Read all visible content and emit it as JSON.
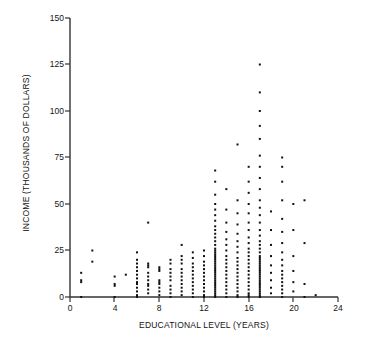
{
  "chart_data": {
    "type": "scatter",
    "title": "",
    "xlabel": "EDUCATIONAL LEVEL (YEARS)",
    "ylabel": "INCOME (THOUSANDS OF DOLLARS)",
    "xlim": [
      0,
      24
    ],
    "ylim": [
      0,
      150
    ],
    "xticks": [
      0,
      4,
      8,
      12,
      16,
      20,
      24
    ],
    "yticks": [
      0,
      25,
      50,
      75,
      100,
      125,
      150
    ],
    "xtick_labels": [
      "0",
      "4",
      "8",
      "12",
      "16",
      "20",
      "24"
    ],
    "ytick_labels": [
      "0",
      "25",
      "50",
      "75",
      "100",
      "125",
      "150"
    ],
    "grid": false,
    "legend": null,
    "marker": "square-dot",
    "marker_color": "#111111",
    "marker_size_px": 2,
    "points": [
      [
        1,
        0
      ],
      [
        1,
        8
      ],
      [
        1,
        9
      ],
      [
        1,
        13
      ],
      [
        2,
        19
      ],
      [
        2,
        25
      ],
      [
        4,
        0
      ],
      [
        4,
        6
      ],
      [
        4,
        7
      ],
      [
        4,
        11
      ],
      [
        5,
        12
      ],
      [
        6,
        0
      ],
      [
        6,
        1
      ],
      [
        6,
        3
      ],
      [
        6,
        5
      ],
      [
        6,
        7
      ],
      [
        6,
        8
      ],
      [
        6,
        10
      ],
      [
        6,
        12
      ],
      [
        6,
        14
      ],
      [
        6,
        16
      ],
      [
        6,
        18
      ],
      [
        6,
        20
      ],
      [
        6,
        24
      ],
      [
        7,
        2
      ],
      [
        7,
        4
      ],
      [
        7,
        6
      ],
      [
        7,
        7
      ],
      [
        7,
        9
      ],
      [
        7,
        11
      ],
      [
        7,
        13
      ],
      [
        7,
        16
      ],
      [
        7,
        17
      ],
      [
        7,
        18
      ],
      [
        7,
        40
      ],
      [
        8,
        1
      ],
      [
        8,
        3
      ],
      [
        8,
        5
      ],
      [
        8,
        7
      ],
      [
        8,
        8
      ],
      [
        8,
        9
      ],
      [
        8,
        14
      ],
      [
        8,
        15
      ],
      [
        8,
        16
      ],
      [
        9,
        0
      ],
      [
        9,
        2
      ],
      [
        9,
        4
      ],
      [
        9,
        6
      ],
      [
        9,
        9
      ],
      [
        9,
        11
      ],
      [
        9,
        13
      ],
      [
        9,
        15
      ],
      [
        9,
        18
      ],
      [
        9,
        20
      ],
      [
        10,
        1
      ],
      [
        10,
        3
      ],
      [
        10,
        5
      ],
      [
        10,
        7
      ],
      [
        10,
        9
      ],
      [
        10,
        11
      ],
      [
        10,
        13
      ],
      [
        10,
        15
      ],
      [
        10,
        18
      ],
      [
        10,
        20
      ],
      [
        10,
        22
      ],
      [
        10,
        28
      ],
      [
        11,
        0
      ],
      [
        11,
        2
      ],
      [
        11,
        4
      ],
      [
        11,
        6
      ],
      [
        11,
        8
      ],
      [
        11,
        10
      ],
      [
        11,
        12
      ],
      [
        11,
        14
      ],
      [
        11,
        16
      ],
      [
        11,
        18
      ],
      [
        11,
        21
      ],
      [
        11,
        24
      ],
      [
        12,
        0
      ],
      [
        12,
        1
      ],
      [
        12,
        3
      ],
      [
        12,
        5
      ],
      [
        12,
        7
      ],
      [
        12,
        9
      ],
      [
        12,
        11
      ],
      [
        12,
        13
      ],
      [
        12,
        15
      ],
      [
        12,
        17
      ],
      [
        12,
        19
      ],
      [
        12,
        22
      ],
      [
        12,
        25
      ],
      [
        13,
        0
      ],
      [
        13,
        1
      ],
      [
        13,
        2
      ],
      [
        13,
        3
      ],
      [
        13,
        4
      ],
      [
        13,
        5
      ],
      [
        13,
        6
      ],
      [
        13,
        7
      ],
      [
        13,
        8
      ],
      [
        13,
        9
      ],
      [
        13,
        10
      ],
      [
        13,
        11
      ],
      [
        13,
        12
      ],
      [
        13,
        13
      ],
      [
        13,
        14
      ],
      [
        13,
        15
      ],
      [
        13,
        16
      ],
      [
        13,
        17
      ],
      [
        13,
        18
      ],
      [
        13,
        19
      ],
      [
        13,
        20
      ],
      [
        13,
        21
      ],
      [
        13,
        22
      ],
      [
        13,
        23
      ],
      [
        13,
        24
      ],
      [
        13,
        25
      ],
      [
        13,
        26
      ],
      [
        13,
        28
      ],
      [
        13,
        30
      ],
      [
        13,
        32
      ],
      [
        13,
        34
      ],
      [
        13,
        36
      ],
      [
        13,
        38
      ],
      [
        13,
        41
      ],
      [
        13,
        44
      ],
      [
        13,
        47
      ],
      [
        13,
        50
      ],
      [
        13,
        55
      ],
      [
        13,
        62
      ],
      [
        13,
        68
      ],
      [
        14,
        0
      ],
      [
        14,
        2
      ],
      [
        14,
        4
      ],
      [
        14,
        6
      ],
      [
        14,
        8
      ],
      [
        14,
        10
      ],
      [
        14,
        12
      ],
      [
        14,
        14
      ],
      [
        14,
        16
      ],
      [
        14,
        18
      ],
      [
        14,
        20
      ],
      [
        14,
        22
      ],
      [
        14,
        25
      ],
      [
        14,
        28
      ],
      [
        14,
        31
      ],
      [
        14,
        35
      ],
      [
        14,
        40
      ],
      [
        14,
        47
      ],
      [
        14,
        58
      ],
      [
        15,
        0
      ],
      [
        15,
        1
      ],
      [
        15,
        3
      ],
      [
        15,
        5
      ],
      [
        15,
        7
      ],
      [
        15,
        9
      ],
      [
        15,
        11
      ],
      [
        15,
        13
      ],
      [
        15,
        15
      ],
      [
        15,
        17
      ],
      [
        15,
        19
      ],
      [
        15,
        21
      ],
      [
        15,
        24
      ],
      [
        15,
        27
      ],
      [
        15,
        30
      ],
      [
        15,
        34
      ],
      [
        15,
        39
      ],
      [
        15,
        45
      ],
      [
        15,
        52
      ],
      [
        15,
        82
      ],
      [
        16,
        0
      ],
      [
        16,
        1
      ],
      [
        16,
        2
      ],
      [
        16,
        4
      ],
      [
        16,
        6
      ],
      [
        16,
        8
      ],
      [
        16,
        10
      ],
      [
        16,
        12
      ],
      [
        16,
        14
      ],
      [
        16,
        16
      ],
      [
        16,
        18
      ],
      [
        16,
        20
      ],
      [
        16,
        22
      ],
      [
        16,
        24
      ],
      [
        16,
        26
      ],
      [
        16,
        29
      ],
      [
        16,
        32
      ],
      [
        16,
        36
      ],
      [
        16,
        40
      ],
      [
        16,
        45
      ],
      [
        16,
        50
      ],
      [
        16,
        56
      ],
      [
        16,
        62
      ],
      [
        16,
        70
      ],
      [
        17,
        0
      ],
      [
        17,
        1
      ],
      [
        17,
        2
      ],
      [
        17,
        3
      ],
      [
        17,
        4
      ],
      [
        17,
        5
      ],
      [
        17,
        6
      ],
      [
        17,
        7
      ],
      [
        17,
        8
      ],
      [
        17,
        9
      ],
      [
        17,
        10
      ],
      [
        17,
        11
      ],
      [
        17,
        12
      ],
      [
        17,
        13
      ],
      [
        17,
        14
      ],
      [
        17,
        15
      ],
      [
        17,
        16
      ],
      [
        17,
        17
      ],
      [
        17,
        18
      ],
      [
        17,
        19
      ],
      [
        17,
        20
      ],
      [
        17,
        21
      ],
      [
        17,
        22
      ],
      [
        17,
        24
      ],
      [
        17,
        26
      ],
      [
        17,
        28
      ],
      [
        17,
        30
      ],
      [
        17,
        33
      ],
      [
        17,
        36
      ],
      [
        17,
        40
      ],
      [
        17,
        44
      ],
      [
        17,
        48
      ],
      [
        17,
        52
      ],
      [
        17,
        58
      ],
      [
        17,
        64
      ],
      [
        17,
        70
      ],
      [
        17,
        76
      ],
      [
        17,
        85
      ],
      [
        17,
        92
      ],
      [
        17,
        100
      ],
      [
        17,
        110
      ],
      [
        17,
        125
      ],
      [
        18,
        2
      ],
      [
        18,
        5
      ],
      [
        18,
        9
      ],
      [
        18,
        13
      ],
      [
        18,
        17
      ],
      [
        18,
        22
      ],
      [
        18,
        28
      ],
      [
        18,
        36
      ],
      [
        18,
        46
      ],
      [
        19,
        0
      ],
      [
        19,
        2
      ],
      [
        19,
        4
      ],
      [
        19,
        6
      ],
      [
        19,
        8
      ],
      [
        19,
        10
      ],
      [
        19,
        12
      ],
      [
        19,
        14
      ],
      [
        19,
        17
      ],
      [
        19,
        20
      ],
      [
        19,
        24
      ],
      [
        19,
        29
      ],
      [
        19,
        35
      ],
      [
        19,
        42
      ],
      [
        19,
        52
      ],
      [
        19,
        62
      ],
      [
        19,
        70
      ],
      [
        19,
        75
      ],
      [
        20,
        3
      ],
      [
        20,
        8
      ],
      [
        20,
        14
      ],
      [
        20,
        22
      ],
      [
        20,
        36
      ],
      [
        20,
        50
      ],
      [
        21,
        0
      ],
      [
        21,
        7
      ],
      [
        21,
        29
      ],
      [
        21,
        52
      ],
      [
        22,
        1
      ]
    ]
  }
}
